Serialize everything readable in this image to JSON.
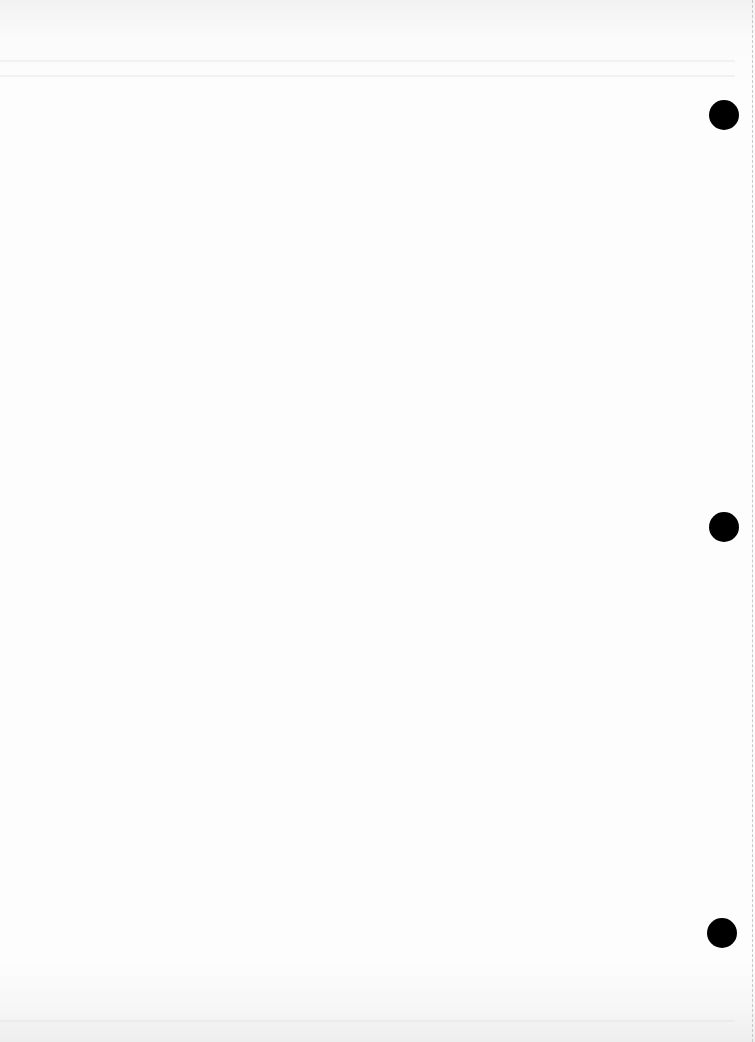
{
  "document": {
    "type": "blank scanned page",
    "punch_holes": [
      {
        "x": 709,
        "y": 100
      },
      {
        "x": 709,
        "y": 512
      },
      {
        "x": 707,
        "y": 918
      }
    ],
    "colors": {
      "paper": "#fdfdfd",
      "hole": "#000000",
      "edge": "#c8c8c8"
    }
  }
}
